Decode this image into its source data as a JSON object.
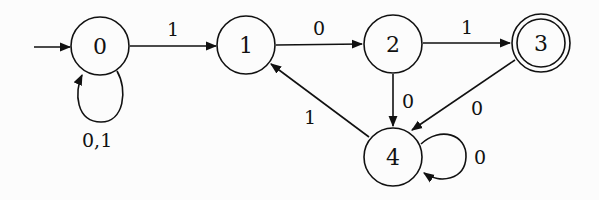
{
  "diagram": {
    "type": "finite-automaton",
    "start_state": "0",
    "accept_states": [
      "3"
    ],
    "states": [
      {
        "id": "0",
        "label": "0",
        "accepting": false
      },
      {
        "id": "1",
        "label": "1",
        "accepting": false
      },
      {
        "id": "2",
        "label": "2",
        "accepting": false
      },
      {
        "id": "3",
        "label": "3",
        "accepting": true
      },
      {
        "id": "4",
        "label": "4",
        "accepting": false
      }
    ],
    "transitions": [
      {
        "from": "0",
        "to": "0",
        "label": "0,1"
      },
      {
        "from": "0",
        "to": "1",
        "label": "1"
      },
      {
        "from": "1",
        "to": "2",
        "label": "0"
      },
      {
        "from": "2",
        "to": "3",
        "label": "1"
      },
      {
        "from": "2",
        "to": "4",
        "label": "0"
      },
      {
        "from": "3",
        "to": "4",
        "label": "0"
      },
      {
        "from": "4",
        "to": "1",
        "label": "1"
      },
      {
        "from": "4",
        "to": "4",
        "label": "0"
      }
    ]
  }
}
